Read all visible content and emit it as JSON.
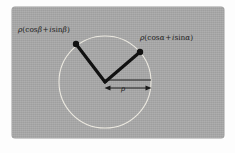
{
  "figure": {
    "panel": {
      "background_color": "#a9a9a9",
      "border_color": "#9b9b9b"
    },
    "circle": {
      "center_x": 105,
      "center_y": 82,
      "radius": 46,
      "stroke_color": "#eceae2",
      "stroke_width": 1.1,
      "fill": "none"
    },
    "origin": {
      "x": 105,
      "y": 82
    },
    "vectors": [
      {
        "name": "vector-beta",
        "end_x": 76,
        "end_y": 44,
        "stroke_color": "#111111",
        "stroke_width": 3.2,
        "dot_radius": 3.1,
        "angle_symbol": "β"
      },
      {
        "name": "vector-alpha",
        "end_x": 140,
        "end_y": 52,
        "stroke_color": "#111111",
        "stroke_width": 3.2,
        "dot_radius": 3.1,
        "angle_symbol": "α"
      }
    ],
    "radius_line": {
      "name": "radius-baseline",
      "x1": 105,
      "y1": 80,
      "x2": 151,
      "y2": 80,
      "stroke_color": "#1a1a1a",
      "stroke_width": 1.1
    },
    "measure_arrow": {
      "name": "rho-measure-arrow",
      "x1": 106,
      "y1": 88,
      "x2": 150,
      "y2": 88,
      "stroke_color": "#1a1a1a",
      "stroke_width": 1.0,
      "double_headed": true
    }
  },
  "labels": {
    "beta": {
      "full_text": "ρ(cos β + i sin β)",
      "rho": "ρ",
      "open_paren": "(",
      "cos": "cos",
      "arg1": "β",
      "plus": "+",
      "i": "i",
      "sin": "sin",
      "arg2": "β",
      "close_paren": ")"
    },
    "alpha": {
      "full_text": "ρ(cos α + i sin α)",
      "rho": "ρ",
      "open_paren": "(",
      "cos": "cos",
      "arg1": "α",
      "plus": "+",
      "i": "i",
      "sin": "sin",
      "arg2": "α",
      "close_paren": ")"
    },
    "rho_measure": "ρ"
  }
}
